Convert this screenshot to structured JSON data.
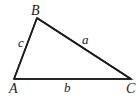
{
  "diagram": {
    "type": "triangle",
    "stroke_color": "#1a1a1a",
    "background": "#ffffff",
    "vertices": [
      {
        "label": "A",
        "x": 14,
        "y": 79
      },
      {
        "label": "B",
        "x": 37,
        "y": 18
      },
      {
        "label": "C",
        "x": 131,
        "y": 79
      }
    ],
    "sides": [
      {
        "label": "a",
        "from": "B",
        "to": "C"
      },
      {
        "label": "b",
        "from": "A",
        "to": "C"
      },
      {
        "label": "c",
        "from": "A",
        "to": "B"
      }
    ],
    "labels": {
      "vertex_a": "A",
      "vertex_b": "B",
      "vertex_c": "C",
      "side_a": "a",
      "side_b": "b",
      "side_c": "c"
    }
  }
}
